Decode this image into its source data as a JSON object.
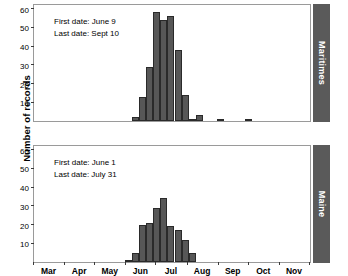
{
  "chart_data": {
    "type": "bar",
    "title": "",
    "xlabel": "",
    "ylabel": "Number of records",
    "ylim": [
      0,
      62
    ],
    "grid": false,
    "legend": "none",
    "x_tick_labels": [
      "Mar",
      "Apr",
      "May",
      "Jun",
      "Jul",
      "Aug",
      "Sep",
      "Oct",
      "Nov"
    ],
    "y_tick_labels": [
      "10",
      "20",
      "30",
      "40",
      "50",
      "60"
    ],
    "y_tick_values": [
      10,
      20,
      30,
      40,
      50,
      60
    ],
    "x_axis_type": "month-of-year",
    "x_range_months": [
      "Mar",
      "Dec"
    ],
    "bar_color": "#575757",
    "strip_color": "#5a5a5a",
    "panels": [
      {
        "strip_label": "Maritimes",
        "first_date_label": "First date: June 9",
        "last_date_label": "Last date: Sept 10",
        "bin_width_days": 7,
        "bins": [
          {
            "start_day": 158,
            "value": 2
          },
          {
            "start_day": 165,
            "value": 13
          },
          {
            "start_day": 172,
            "value": 29
          },
          {
            "start_day": 179,
            "value": 58
          },
          {
            "start_day": 186,
            "value": 54
          },
          {
            "start_day": 193,
            "value": 56
          },
          {
            "start_day": 200,
            "value": 38
          },
          {
            "start_day": 207,
            "value": 14
          },
          {
            "start_day": 214,
            "value": 1
          },
          {
            "start_day": 221,
            "value": 3
          },
          {
            "start_day": 242,
            "value": 1
          },
          {
            "start_day": 270,
            "value": 1
          }
        ]
      },
      {
        "strip_label": "Maine",
        "first_date_label": "First date: June 1",
        "last_date_label": "Last date: July 31",
        "bin_width_days": 7,
        "bins": [
          {
            "start_day": 151,
            "value": 1
          },
          {
            "start_day": 158,
            "value": 5
          },
          {
            "start_day": 165,
            "value": 20
          },
          {
            "start_day": 172,
            "value": 21
          },
          {
            "start_day": 179,
            "value": 29
          },
          {
            "start_day": 186,
            "value": 34
          },
          {
            "start_day": 193,
            "value": 19
          },
          {
            "start_day": 200,
            "value": 17
          },
          {
            "start_day": 207,
            "value": 12
          },
          {
            "start_day": 214,
            "value": 5
          }
        ]
      }
    ]
  }
}
